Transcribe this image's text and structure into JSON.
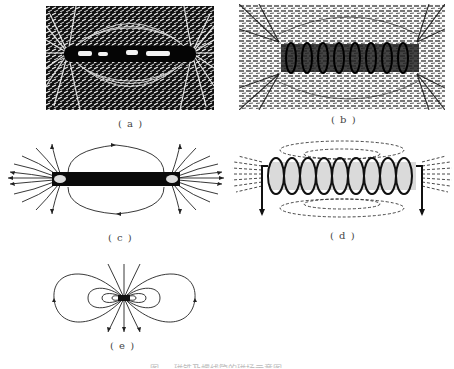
{
  "figure": {
    "panels": [
      {
        "id": "a",
        "label": "( a )",
        "description": "Iron filings around a bar magnet"
      },
      {
        "id": "b",
        "label": "( b )",
        "description": "Iron filings around a current-carrying solenoid"
      },
      {
        "id": "c",
        "label": "( c )",
        "description": "Field lines of a bar magnet"
      },
      {
        "id": "d",
        "label": "( d )",
        "description": "Field lines of a solenoid"
      },
      {
        "id": "e",
        "label": "( e )",
        "description": "Field lines of a small magnetic dipole"
      }
    ],
    "caption": "图 ⋯ 磁铁及螺线管的磁场示意图"
  },
  "colors": {
    "ink": "#1a1a1a",
    "filings_bg": "#0d0d0d",
    "filings_fg": "#f2f2f2",
    "paper": "#ffffff"
  }
}
